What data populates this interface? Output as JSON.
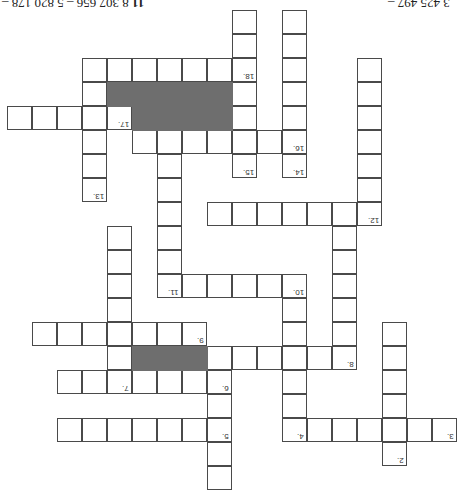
{
  "puzzle": {
    "orientation": "rotated-180",
    "header_left": {
      "problem_number": "11",
      "text": "8 307 656 – 5 820 178 –"
    },
    "header_right": {
      "text": "3 425 497 –"
    },
    "grid": {
      "origin_x": 7,
      "origin_y": 10,
      "cell_w": 25,
      "cell_h": 24,
      "cells": [
        [
          9,
          0
        ],
        [
          9,
          1
        ],
        [
          9,
          2
        ],
        [
          9,
          3
        ],
        [
          9,
          4
        ],
        [
          9,
          5
        ],
        [
          9,
          6
        ],
        [
          11,
          0
        ],
        [
          11,
          1
        ],
        [
          11,
          2
        ],
        [
          11,
          3
        ],
        [
          11,
          4
        ],
        [
          11,
          5
        ],
        [
          11,
          6
        ],
        [
          3,
          2
        ],
        [
          4,
          2
        ],
        [
          5,
          2
        ],
        [
          6,
          2
        ],
        [
          7,
          2
        ],
        [
          8,
          2
        ],
        [
          3,
          3
        ],
        [
          3,
          4
        ],
        [
          3,
          5
        ],
        [
          3,
          6
        ],
        [
          3,
          7
        ],
        [
          0,
          4
        ],
        [
          1,
          4
        ],
        [
          2,
          4
        ],
        [
          4,
          4
        ],
        [
          5,
          5
        ],
        [
          6,
          5
        ],
        [
          7,
          5
        ],
        [
          8,
          5
        ],
        [
          10,
          5
        ],
        [
          14,
          2
        ],
        [
          14,
          3
        ],
        [
          14,
          4
        ],
        [
          14,
          5
        ],
        [
          14,
          6
        ],
        [
          14,
          7
        ],
        [
          14,
          8
        ],
        [
          8,
          8
        ],
        [
          9,
          8
        ],
        [
          10,
          8
        ],
        [
          11,
          8
        ],
        [
          12,
          8
        ],
        [
          13,
          8
        ],
        [
          6,
          6
        ],
        [
          6,
          7
        ],
        [
          6,
          8
        ],
        [
          6,
          9
        ],
        [
          6,
          10
        ],
        [
          6,
          11
        ],
        [
          7,
          11
        ],
        [
          8,
          11
        ],
        [
          9,
          11
        ],
        [
          10,
          11
        ],
        [
          11,
          11
        ],
        [
          13,
          9
        ],
        [
          13,
          10
        ],
        [
          13,
          11
        ],
        [
          13,
          12
        ],
        [
          13,
          13
        ],
        [
          13,
          14
        ],
        [
          4,
          9
        ],
        [
          4,
          10
        ],
        [
          4,
          11
        ],
        [
          4,
          12
        ],
        [
          4,
          13
        ],
        [
          4,
          14
        ],
        [
          4,
          15
        ],
        [
          1,
          13
        ],
        [
          2,
          13
        ],
        [
          3,
          13
        ],
        [
          5,
          13
        ],
        [
          6,
          13
        ],
        [
          7,
          13
        ],
        [
          8,
          14
        ],
        [
          9,
          14
        ],
        [
          10,
          14
        ],
        [
          11,
          14
        ],
        [
          12,
          14
        ],
        [
          2,
          15
        ],
        [
          3,
          15
        ],
        [
          5,
          15
        ],
        [
          6,
          15
        ],
        [
          7,
          15
        ],
        [
          8,
          15
        ],
        [
          8,
          16
        ],
        [
          8,
          17
        ],
        [
          8,
          18
        ],
        [
          8,
          19
        ],
        [
          11,
          12
        ],
        [
          11,
          13
        ],
        [
          11,
          15
        ],
        [
          11,
          16
        ],
        [
          11,
          17
        ],
        [
          2,
          17
        ],
        [
          3,
          17
        ],
        [
          4,
          17
        ],
        [
          5,
          17
        ],
        [
          6,
          17
        ],
        [
          7,
          17
        ],
        [
          12,
          17
        ],
        [
          13,
          17
        ],
        [
          14,
          17
        ],
        [
          15,
          17
        ],
        [
          16,
          17
        ],
        [
          17,
          17
        ],
        [
          15,
          13
        ],
        [
          15,
          14
        ],
        [
          15,
          15
        ],
        [
          15,
          16
        ],
        [
          15,
          18
        ]
      ],
      "blocks": [
        [
          4,
          3
        ],
        [
          5,
          3
        ],
        [
          6,
          3
        ],
        [
          7,
          3
        ],
        [
          8,
          3
        ],
        [
          5,
          4
        ],
        [
          6,
          4
        ],
        [
          7,
          4
        ],
        [
          8,
          4
        ],
        [
          5,
          14
        ],
        [
          6,
          14
        ],
        [
          7,
          14
        ]
      ],
      "numbers": [
        {
          "label": "2.",
          "col": 15,
          "row": 18
        },
        {
          "label": "3.",
          "col": 17,
          "row": 17
        },
        {
          "label": "4.",
          "col": 11,
          "row": 17
        },
        {
          "label": "5.",
          "col": 8,
          "row": 17
        },
        {
          "label": "6.",
          "col": 8,
          "row": 15
        },
        {
          "label": "7.",
          "col": 4,
          "row": 15
        },
        {
          "label": "8.",
          "col": 13,
          "row": 14
        },
        {
          "label": "9.",
          "col": 7,
          "row": 13
        },
        {
          "label": "10.",
          "col": 11,
          "row": 11
        },
        {
          "label": "11.",
          "col": 6,
          "row": 11
        },
        {
          "label": "12.",
          "col": 14,
          "row": 8
        },
        {
          "label": "13.",
          "col": 3,
          "row": 7
        },
        {
          "label": "14.",
          "col": 11,
          "row": 6
        },
        {
          "label": "15.",
          "col": 9,
          "row": 6
        },
        {
          "label": "16.",
          "col": 11,
          "row": 5
        },
        {
          "label": "17.",
          "col": 4,
          "row": 4
        },
        {
          "label": "18.",
          "col": 9,
          "row": 2
        }
      ]
    },
    "colors": {
      "cell_border": "#4a4a4a",
      "block_fill": "#6e6e6e",
      "background": "#ffffff"
    }
  }
}
